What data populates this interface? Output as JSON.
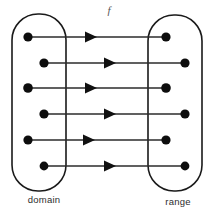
{
  "figure": {
    "function_label": "f",
    "function_label_x": 109,
    "function_label_y": 14,
    "background_color": "#ffffff",
    "line_color": "#2b2b2b",
    "dot_color": "#0d0d0d",
    "oval_stroke_color": "#1a1a1a"
  },
  "sets": {
    "domain": {
      "caption": "domain",
      "caption_x": 44,
      "caption_y": 203,
      "oval": {
        "x": 12,
        "y": 14,
        "width": 54,
        "height": 177,
        "rx": 26,
        "ry": 26
      }
    },
    "range": {
      "caption": "range",
      "caption_x": 178,
      "caption_y": 205,
      "oval": {
        "x": 148,
        "y": 15,
        "width": 54,
        "height": 176,
        "rx": 26,
        "ry": 26
      }
    }
  },
  "mappings": [
    {
      "index": 1,
      "y": 37,
      "source_x": 28,
      "target_x": 166,
      "arrow_tip_x": 97,
      "dot_radius": 4.6
    },
    {
      "index": 2,
      "y": 63,
      "source_x": 44,
      "target_x": 185,
      "arrow_tip_x": 116,
      "dot_radius": 4.6
    },
    {
      "index": 3,
      "y": 88,
      "source_x": 28,
      "target_x": 166,
      "arrow_tip_x": 97,
      "dot_radius": 4.8
    },
    {
      "index": 4,
      "y": 114,
      "source_x": 44,
      "target_x": 185,
      "arrow_tip_x": 116,
      "dot_radius": 4.6
    },
    {
      "index": 5,
      "y": 140,
      "source_x": 28,
      "target_x": 166,
      "arrow_tip_x": 95,
      "dot_radius": 4.6
    },
    {
      "index": 6,
      "y": 166,
      "source_x": 44,
      "target_x": 185,
      "arrow_tip_x": 116,
      "dot_radius": 4.4
    }
  ],
  "arrowhead": {
    "length": 12,
    "half_height": 5.5
  }
}
